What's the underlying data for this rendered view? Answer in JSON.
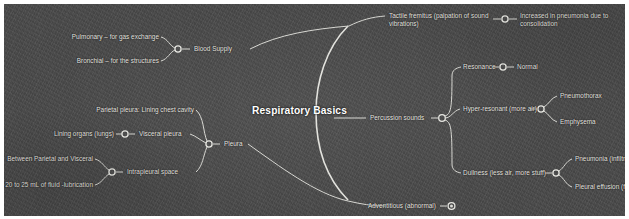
{
  "map": {
    "center_label": "Respiratory Basics",
    "background_color": "#4a4a4a",
    "line_color": "#d7d7d2",
    "text_color": "#eceae4"
  },
  "branches": {
    "blood_supply": {
      "label": "Blood Supply",
      "children": [
        "Pulmonary – for gas exchange",
        "Bronchial – for the structures"
      ]
    },
    "pleura": {
      "label": "Pleura",
      "children": [
        "Parietal pleura: Lining chest cavity",
        "Visceral pleura",
        "Intrapleural space"
      ],
      "visceral_children": [
        "Lining organs (lungs)"
      ],
      "intrapleural_children": [
        "Between Parietal and Visceral",
        "20 to 25 mL of fluid -lubrication"
      ]
    },
    "tactile_fremitus": {
      "label": "Tactile fremitus (palpation of sound vibrations)",
      "children": [
        "Increased in pneumonia due to consolidation"
      ]
    },
    "percussion_sounds": {
      "label": "Percussion sounds",
      "children": [
        {
          "label": "Resonance",
          "children": [
            "Normal"
          ]
        },
        {
          "label": "Hyper-resonant (more air)",
          "children": [
            "Pneumothorax",
            "Emphysema"
          ]
        },
        {
          "label": "Dullness (less air, more stuff)",
          "children": [
            "Pneumonia (infiltrates)",
            "Pleural effusion (fluid)"
          ]
        }
      ]
    },
    "adventitious": {
      "label": "Adventitious (abnormal)",
      "collapsed": true
    }
  }
}
